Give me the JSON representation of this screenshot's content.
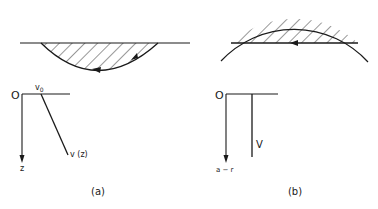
{
  "figure": {
    "panel_a": {
      "caption": "(a)",
      "origin_label": "O",
      "surface_velocity_label": "v",
      "surface_velocity_subscript": "0",
      "depth_axis_label": "z",
      "profile_label": "v (z)",
      "description": "Half-space with linear velocity gradient; ray path curves below flat surface"
    },
    "panel_b": {
      "caption": "(b)",
      "origin_label": "O",
      "depth_axis_label": "a − r",
      "profile_label": "V",
      "description": "Spherical earth with constant velocity; straight chord ray below curved surface"
    },
    "colors": {
      "ink": "#1a1a1a",
      "background": "#ffffff"
    }
  }
}
